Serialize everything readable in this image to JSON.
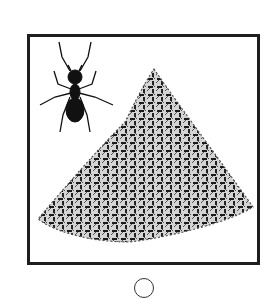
{
  "question_option": {
    "image_description": "A single ant beside a large pile of many ants",
    "elements": {
      "single_ant": "ant-icon",
      "ant_pile": "ant-pile-image"
    },
    "radio": {
      "selected": false,
      "icon": "radio-circle-icon"
    }
  },
  "colors": {
    "frame": "#1e1e1e",
    "ant": "#111111",
    "pile_light": "#cfcfcf",
    "radio_border": "#333333"
  }
}
